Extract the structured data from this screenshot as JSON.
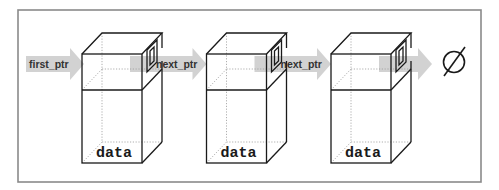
{
  "diagram": {
    "head_pointer_label": "first_ptr",
    "nodes": [
      {
        "data_label": "data",
        "next_label": "next_ptr"
      },
      {
        "data_label": "data",
        "next_label": "next_ptr"
      },
      {
        "data_label": "data",
        "next_label": ""
      }
    ],
    "terminator": {
      "symbol": "∅",
      "meaning": "null"
    },
    "colors": {
      "frame": "#8a8a8a",
      "edge": "#1a1a1a",
      "arrow": "#d2d2d2",
      "text": "#333333"
    }
  }
}
